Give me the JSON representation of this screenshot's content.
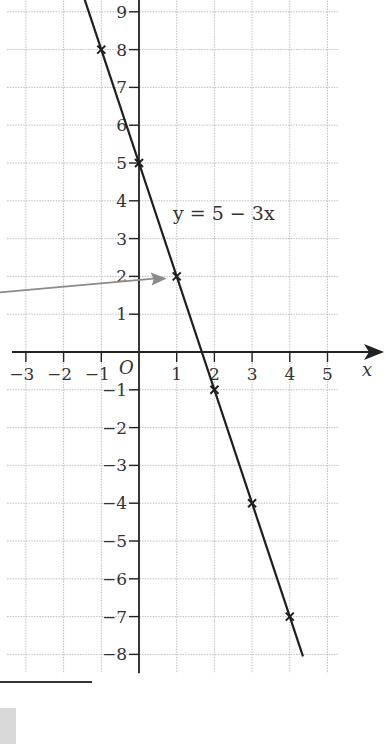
{
  "chart_data": {
    "type": "line",
    "title": "",
    "equation_label": "y = 5 − 3x",
    "xlabel": "x",
    "ylabel": "",
    "origin_label": "O",
    "xlim": [
      -3.5,
      5.3
    ],
    "ylim": [
      -8.5,
      9.3
    ],
    "grid": true,
    "x_ticks": [
      -3,
      -2,
      -1,
      1,
      2,
      3,
      4,
      5
    ],
    "x_tick_labels": [
      "−3",
      "−2",
      "−1",
      "1",
      "2",
      "3",
      "4",
      "5"
    ],
    "y_ticks": [
      9,
      8,
      7,
      6,
      5,
      4,
      3,
      2,
      1,
      -1,
      -2,
      -3,
      -4,
      -5,
      -6,
      -7,
      -8
    ],
    "y_tick_labels": [
      "9",
      "8",
      "7",
      "6",
      "5",
      "4",
      "3",
      "2",
      "1",
      "−1",
      "−2",
      "−3",
      "−4",
      "−5",
      "−6",
      "−7",
      "−8"
    ],
    "series": [
      {
        "name": "y = 5 − 3x",
        "slope": -3,
        "intercept": 5,
        "x_range": [
          -1.45,
          4.35
        ]
      }
    ],
    "marked_points": [
      {
        "x": -1,
        "y": 8
      },
      {
        "x": 0,
        "y": 5
      },
      {
        "x": 1,
        "y": 2
      },
      {
        "x": 2,
        "y": -1
      },
      {
        "x": 3,
        "y": -4
      },
      {
        "x": 4,
        "y": -7
      }
    ],
    "annotations": [
      {
        "type": "arrow",
        "points_to": {
          "x": 1,
          "y": 2
        },
        "from": "left"
      }
    ]
  }
}
